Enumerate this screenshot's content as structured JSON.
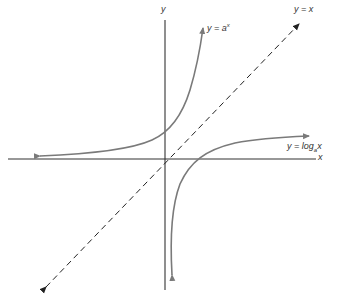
{
  "diagram": {
    "title": "",
    "axes": {
      "x_label": "x",
      "y_label": "y"
    },
    "curves": [
      {
        "id": "exponential",
        "label_prefix": "y = a",
        "label_sup": "x",
        "color": "#7a7a7a",
        "style": "solid"
      },
      {
        "id": "logarithm",
        "label_prefix": "y = log",
        "label_sub": "a",
        "label_suffix": "x",
        "color": "#7a7a7a",
        "style": "solid"
      },
      {
        "id": "identity",
        "label": "y = x",
        "color": "#222222",
        "style": "dashed"
      }
    ],
    "colors": {
      "axis": "#333333",
      "curve": "#7a7a7a",
      "dashed_line": "#222222",
      "background": "#ffffff"
    }
  }
}
